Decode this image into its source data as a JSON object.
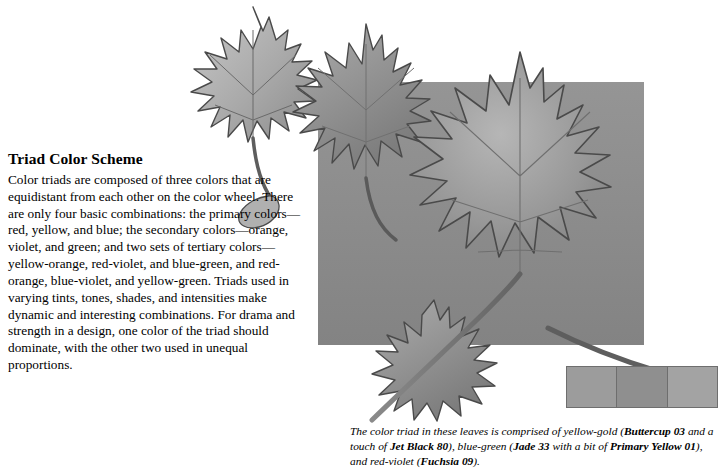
{
  "page": {
    "heading": "Triad Color Scheme",
    "body": "Color triads are composed of three colors that are equidistant from each other on the color wheel. There are only four basic combinations: the primary colors—red, yellow, and blue; the secondary colors—orange, violet, and green; and two sets of tertiary colors—yellow-orange, red-violet, and blue-green, and red-orange, blue-violet, and yellow-green. Triads used in varying tints, tones, shades, and intensities make dynamic and interesting combinations. For drama and strength in a design, one color of the triad should dominate, with the other two used in unequal proportions."
  },
  "caption": {
    "lead": "The color triad in these leaves is comprised of yellow-gold (",
    "color1": "Buttercup 03",
    "mid1": " and a touch of ",
    "color2": "Jet Black 80",
    "mid2": "), blue-green (",
    "color3": "Jade 33",
    "mid3": " with a bit of ",
    "color4": "Primary Yellow 01",
    "mid4": "), and red-violet (",
    "color5": "Fuchsia 09",
    "tail": ")."
  },
  "artwork": {
    "background_square_color": "#8d8d8d",
    "leaf_fill_light": "#b3b3b3",
    "leaf_fill_mid": "#9a9a9a",
    "leaf_fill_dark": "#7e7e7e",
    "outline_color": "#4a4a4a",
    "stem_color": "#6f6f6f",
    "swatch_colors": [
      "#9c9c9c",
      "#8f8f8f",
      "#a3a3a3"
    ]
  }
}
